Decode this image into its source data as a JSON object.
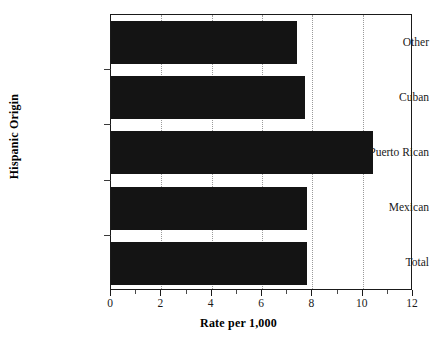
{
  "chart_data": {
    "type": "bar",
    "orientation": "horizontal",
    "title": "",
    "xlabel": "Rate per 1,000",
    "ylabel": "Hispanic Origin",
    "categories": [
      "Other",
      "Cuban",
      "Puerto Rican",
      "Mexican",
      "Total"
    ],
    "values": [
      7.4,
      7.7,
      10.4,
      7.8,
      7.8
    ],
    "xlim": [
      0,
      12
    ],
    "xticks": [
      0,
      2,
      4,
      6,
      8,
      10,
      12
    ],
    "xtick_labels": [
      "0",
      "2",
      "4",
      "6",
      "8",
      "10",
      "12"
    ],
    "xminor_ticks": [
      1,
      3,
      5,
      7,
      9,
      11
    ],
    "grid": "vertical-dotted-at-major-ticks",
    "legend": "none",
    "bar_color": "#141414",
    "frame_color": "#1a1a1a",
    "grid_color": "#9a9a9a",
    "background": "#ffffff"
  },
  "axis": {
    "x_title": "Rate per 1,000",
    "y_title": "Hispanic Origin"
  },
  "categories": [
    {
      "label": "Other",
      "value": 7.4
    },
    {
      "label": "Cuban",
      "value": 7.7
    },
    {
      "label": "Puerto Rican",
      "value": 10.4
    },
    {
      "label": "Mexican",
      "value": 7.8
    },
    {
      "label": "Total",
      "value": 7.8
    }
  ],
  "xticks": [
    {
      "value": 0,
      "label": "0"
    },
    {
      "value": 2,
      "label": "2"
    },
    {
      "value": 4,
      "label": "4"
    },
    {
      "value": 6,
      "label": "6"
    },
    {
      "value": 8,
      "label": "8"
    },
    {
      "value": 10,
      "label": "10"
    },
    {
      "value": 12,
      "label": "12"
    }
  ]
}
